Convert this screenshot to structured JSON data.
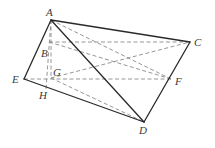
{
  "diagram": {
    "type": "geometry-figure",
    "points": {
      "A": {
        "label": "A",
        "x": 51,
        "y": 20,
        "lx": 46,
        "ly": 16
      },
      "B": {
        "label": "B",
        "x": 49,
        "y": 42,
        "lx": 41,
        "ly": 57
      },
      "C": {
        "label": "C",
        "x": 190,
        "y": 42,
        "lx": 194,
        "ly": 46
      },
      "E": {
        "label": "E",
        "x": 24,
        "y": 79,
        "lx": 12,
        "ly": 83
      },
      "G": {
        "label": "G",
        "x": 51,
        "y": 78,
        "lx": 53,
        "ly": 76
      },
      "H": {
        "label": "H",
        "x": 46,
        "y": 89,
        "lx": 39,
        "ly": 99
      },
      "F": {
        "label": "F",
        "x": 171,
        "y": 79,
        "lx": 175,
        "ly": 85
      },
      "D": {
        "label": "D",
        "x": 144,
        "y": 122,
        "lx": 139,
        "ly": 134
      }
    },
    "solid_edges": [
      [
        "A",
        "C"
      ],
      [
        "A",
        "E"
      ],
      [
        "A",
        "D"
      ],
      [
        "E",
        "D"
      ],
      [
        "C",
        "D"
      ]
    ],
    "dashed_edges": [
      [
        "A",
        "H"
      ],
      [
        "A",
        "G"
      ],
      [
        "B",
        "C"
      ],
      [
        "B",
        "F"
      ],
      [
        "A",
        "F"
      ],
      [
        "G",
        "C"
      ],
      [
        "E",
        "F"
      ],
      [
        "G",
        "D"
      ]
    ],
    "colors": {
      "solid": "#2a2a2a",
      "dashed": "#8a8a8a",
      "label": "#3a3a3a"
    }
  }
}
